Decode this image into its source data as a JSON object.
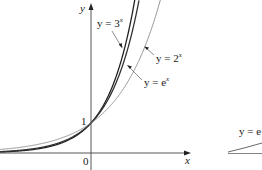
{
  "chart_data": {
    "type": "line",
    "title": "",
    "xlabel": "x",
    "ylabel": "y",
    "origin_label": "0",
    "y_tick_labels": [
      "1"
    ],
    "xlim": [
      -3.03,
      3.3
    ],
    "ylim": [
      -0.55,
      5.1
    ],
    "grid": false,
    "legend": "inline labels with arrows",
    "series": [
      {
        "name": "y = 3^x",
        "base": 3,
        "label_text": "y = 3",
        "label_exp": "x",
        "color": "#222222",
        "width": 1.3
      },
      {
        "name": "y = e^x",
        "base": 2.718281828,
        "label_text": "y = e",
        "label_exp": "x",
        "color": "#333333",
        "width": 1.3
      },
      {
        "name": "y = 2^x",
        "base": 2,
        "label_text": "y = 2",
        "label_exp": "x",
        "color": "#888888",
        "width": 0.9
      }
    ],
    "partial_second_panel_label": "y = e"
  }
}
